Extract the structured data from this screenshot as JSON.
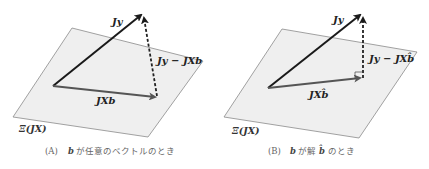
{
  "colors": {
    "plane_fill": "#efefef",
    "plane_stroke": "#8a8a8a",
    "vector_jy": "#1a1a1a",
    "vector_jxb": "#555555",
    "residual": "#222222",
    "caption": "#666666"
  },
  "panels": [
    {
      "id": "A",
      "vectors": {
        "jy_label": "Jy",
        "residual_label": "Jy − JXb",
        "projection_label": "JXb"
      },
      "plane_label": "Ξ(JX)",
      "caption": {
        "marker": "(A)",
        "var": "b",
        "text": "が任意のベクトルのとき"
      }
    },
    {
      "id": "B",
      "vectors": {
        "jy_label": "Jy",
        "residual_label": "Jy − JXb̂",
        "projection_label": "JXb̂"
      },
      "plane_label": "Ξ(JX)",
      "caption": {
        "marker": "(B)",
        "var": "b",
        "text_mid": "が解",
        "var_hat": "b̂",
        "text_end": "のとき"
      }
    }
  ]
}
